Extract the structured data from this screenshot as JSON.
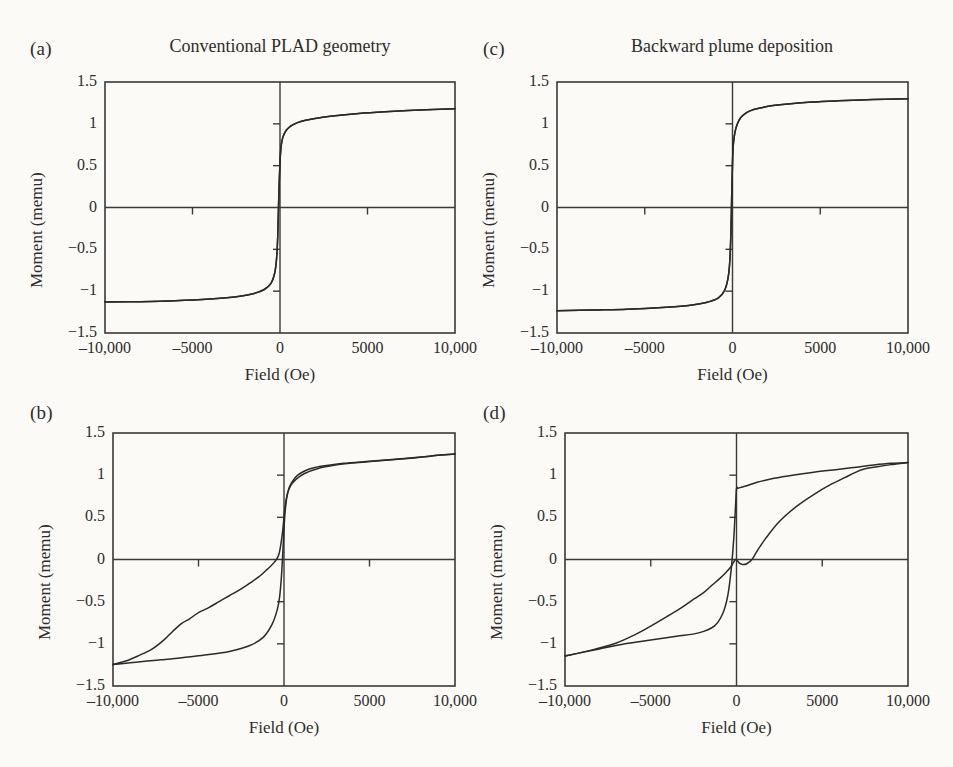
{
  "figure": {
    "background": "#fbfaf7",
    "ink": "#2a2a2a",
    "panel_count": 4
  },
  "panels": [
    {
      "key": "a",
      "label": "(a)",
      "title": "Conventional PLAD geometry",
      "xlabel": "Field (Oe)",
      "ylabel": "Moment (memu)"
    },
    {
      "key": "c",
      "label": "(c)",
      "title": "Backward plume deposition",
      "xlabel": "Field (Oe)",
      "ylabel": "Moment (memu)"
    },
    {
      "key": "b",
      "label": "(b)",
      "title": "",
      "xlabel": "Field (Oe)",
      "ylabel": "Moment (memu)"
    },
    {
      "key": "d",
      "label": "(d)",
      "title": "",
      "xlabel": "Field (Oe)",
      "ylabel": "Moment (memu)"
    }
  ],
  "axes": {
    "x_ticklabels": [
      "–10,000",
      "–5000",
      "0",
      "5000",
      "10,000"
    ],
    "x_tickvalues": [
      -10000,
      -5000,
      0,
      5000,
      10000
    ],
    "y_ticklabels": [
      "1.5",
      "1",
      "0.5",
      "0",
      "−0.5",
      "−1",
      "−1.5"
    ],
    "y_tickvalues": [
      1.5,
      1,
      0.5,
      0,
      -0.5,
      -1,
      -1.5
    ],
    "xlim": [
      -10000,
      10000
    ],
    "ylim": [
      -1.5,
      1.5
    ],
    "grid": false,
    "interior_ticks_on_zero_axes": true
  },
  "chart_data": [
    {
      "id": "a",
      "type": "line",
      "title": "Conventional PLAD geometry",
      "panel_label": "(a)",
      "xlabel": "Field (Oe)",
      "ylabel": "Moment (memu)",
      "xlim": [
        -10000,
        10000
      ],
      "ylim": [
        -1.5,
        1.5
      ],
      "grid": false,
      "legend": "none",
      "description": "Narrow soft-magnetic hysteresis loop, small coercivity, saturation about 1.18 memu",
      "saturation_moment": 1.18,
      "coercivity_oe": 160,
      "remanence_memu": 0.6,
      "series": [
        {
          "name": "descending-branch",
          "x": [
            10000,
            8000,
            6000,
            4500,
            3000,
            2000,
            1400,
            1000,
            700,
            450,
            300,
            180,
            90,
            20,
            -60,
            -130,
            -200,
            -300,
            -500,
            -900,
            -1600,
            -2600,
            -4000,
            -6000,
            -8000,
            -10000
          ],
          "y": [
            1.18,
            1.165,
            1.145,
            1.125,
            1.095,
            1.065,
            1.04,
            1.015,
            0.985,
            0.945,
            0.905,
            0.85,
            0.77,
            0.62,
            0.2,
            -0.35,
            -0.62,
            -0.78,
            -0.9,
            -0.98,
            -1.035,
            -1.07,
            -1.095,
            -1.115,
            -1.125,
            -1.13
          ]
        },
        {
          "name": "ascending-branch",
          "x": [
            -10000,
            -8000,
            -6000,
            -4000,
            -2600,
            -1600,
            -900,
            -500,
            -300,
            -200,
            -130,
            -60,
            20,
            90,
            180,
            300,
            450,
            700,
            1000,
            1400,
            2000,
            3000,
            4500,
            6000,
            8000,
            10000
          ],
          "y": [
            -1.13,
            -1.125,
            -1.115,
            -1.095,
            -1.07,
            -1.035,
            -0.98,
            -0.9,
            -0.78,
            -0.62,
            -0.35,
            0.2,
            0.62,
            0.77,
            0.85,
            0.905,
            0.945,
            0.985,
            1.015,
            1.04,
            1.065,
            1.095,
            1.125,
            1.145,
            1.165,
            1.18
          ]
        }
      ]
    },
    {
      "id": "c",
      "type": "line",
      "title": "Backward plume deposition",
      "panel_label": "(c)",
      "xlabel": "Field (Oe)",
      "ylabel": "Moment (memu)",
      "xlim": [
        -10000,
        10000
      ],
      "ylim": [
        -1.5,
        1.5
      ],
      "grid": false,
      "legend": "none",
      "description": "Narrow soft-magnetic hysteresis loop, saturation about 1.30 memu",
      "saturation_moment": 1.3,
      "coercivity_oe": 120,
      "remanence_memu": 0.55,
      "series": [
        {
          "name": "descending-branch",
          "x": [
            10000,
            8000,
            6000,
            4500,
            3000,
            2200,
            1500,
            1000,
            700,
            450,
            280,
            150,
            60,
            10,
            -40,
            -90,
            -160,
            -260,
            -450,
            -800,
            -1500,
            -2500,
            -4000,
            -6000,
            -8000,
            -10000
          ],
          "y": [
            1.3,
            1.29,
            1.275,
            1.26,
            1.235,
            1.215,
            1.185,
            1.155,
            1.12,
            1.07,
            1.0,
            0.91,
            0.78,
            0.6,
            0.2,
            -0.3,
            -0.66,
            -0.85,
            -0.99,
            -1.08,
            -1.135,
            -1.17,
            -1.195,
            -1.215,
            -1.225,
            -1.235
          ]
        },
        {
          "name": "ascending-branch",
          "x": [
            -10000,
            -8000,
            -6000,
            -4000,
            -2500,
            -1500,
            -800,
            -450,
            -260,
            -160,
            -90,
            -40,
            10,
            60,
            150,
            280,
            450,
            700,
            1000,
            1500,
            2200,
            3000,
            4500,
            6000,
            8000,
            10000
          ],
          "y": [
            -1.235,
            -1.225,
            -1.215,
            -1.195,
            -1.17,
            -1.135,
            -1.08,
            -0.99,
            -0.85,
            -0.66,
            -0.3,
            0.2,
            0.6,
            0.78,
            0.91,
            1.0,
            1.07,
            1.12,
            1.155,
            1.185,
            1.215,
            1.235,
            1.26,
            1.275,
            1.29,
            1.3
          ]
        }
      ]
    },
    {
      "id": "b",
      "type": "line",
      "title": "",
      "panel_label": "(b)",
      "xlabel": "Field (Oe)",
      "ylabel": "Moment (memu)",
      "xlim": [
        -10000,
        10000
      ],
      "ylim": [
        -1.5,
        1.5
      ],
      "grid": false,
      "legend": "none",
      "description": "Wide open hysteresis loop with a distinct shoulder near -6500 Oe on the descending branch; two-phase exchange-spring behaviour",
      "saturation_moment": 1.25,
      "coercivity_oe": 800,
      "remanence_memu": 0.95,
      "series": [
        {
          "name": "descending-branch",
          "x": [
            10000,
            9000,
            8000,
            6500,
            5000,
            3500,
            2500,
            1800,
            1200,
            800,
            500,
            300,
            150,
            40,
            -60,
            -150,
            -260,
            -400,
            -700,
            -1200,
            -2000,
            -3200,
            -4500,
            -5600,
            -6400,
            -7200,
            -8000,
            -9000,
            -10000
          ],
          "y": [
            1.25,
            1.235,
            1.215,
            1.19,
            1.165,
            1.14,
            1.115,
            1.09,
            1.05,
            1.0,
            0.93,
            0.85,
            0.72,
            0.5,
            0.12,
            -0.2,
            -0.45,
            -0.6,
            -0.77,
            -0.92,
            -1.02,
            -1.09,
            -1.13,
            -1.155,
            -1.175,
            -1.19,
            -1.205,
            -1.225,
            -1.245
          ]
        },
        {
          "name": "ascending-branch",
          "x": [
            -10000,
            -9200,
            -8500,
            -7700,
            -7000,
            -6500,
            -6000,
            -5500,
            -5000,
            -4400,
            -3800,
            -3200,
            -2600,
            -2000,
            -1500,
            -1000,
            -600,
            -300,
            -100,
            60,
            200,
            400,
            700,
            1200,
            2000,
            3000,
            4000,
            5200,
            6500,
            7600,
            8500,
            9200,
            10000
          ],
          "y": [
            -1.245,
            -1.2,
            -1.14,
            -1.06,
            -0.95,
            -0.85,
            -0.76,
            -0.7,
            -0.63,
            -0.57,
            -0.5,
            -0.43,
            -0.36,
            -0.28,
            -0.21,
            -0.12,
            -0.04,
            0.06,
            0.3,
            0.62,
            0.78,
            0.88,
            0.95,
            1.02,
            1.08,
            1.12,
            1.145,
            1.165,
            1.185,
            1.205,
            1.225,
            1.24,
            1.25
          ]
        }
      ]
    },
    {
      "id": "d",
      "type": "line",
      "title": "",
      "panel_label": "(d)",
      "xlabel": "Field (Oe)",
      "ylabel": "Moment (memu)",
      "xlim": [
        -10000,
        10000
      ],
      "ylim": [
        -1.5,
        1.5
      ],
      "grid": false,
      "legend": "none",
      "description": "Wide open loop with an abrupt near-zero-field jump from -0.85 to +0.85 memu on the reversing branch; sheared second branch saturating near 7000 Oe",
      "saturation_moment": 1.15,
      "coercivity_oe": 950,
      "remanence_memu": 0.85,
      "series": [
        {
          "name": "descending-branch",
          "x": [
            10000,
            9000,
            8000,
            7000,
            6000,
            4500,
            3000,
            2000,
            1200,
            600,
            250,
            80,
            0,
            -60,
            -160,
            -300,
            -500,
            -800,
            -1300,
            -2200,
            -3500,
            -5000,
            -6500,
            -8000,
            -9200,
            -10000
          ],
          "y": [
            1.15,
            1.14,
            1.12,
            1.095,
            1.07,
            1.035,
            0.99,
            0.955,
            0.915,
            0.875,
            0.855,
            0.845,
            0.84,
            0.62,
            0.25,
            -0.1,
            -0.42,
            -0.64,
            -0.79,
            -0.87,
            -0.91,
            -0.955,
            -1.0,
            -1.06,
            -1.11,
            -1.145
          ]
        },
        {
          "name": "ascending-branch",
          "x": [
            -10000,
            -9200,
            -8200,
            -7000,
            -6000,
            -5000,
            -4000,
            -3200,
            -2500,
            -1900,
            -1400,
            -1000,
            -600,
            -300,
            -60,
            150,
            350,
            600,
            900,
            1200,
            1700,
            2500,
            3500,
            4500,
            5500,
            6300,
            6900,
            7400,
            8200,
            9000,
            10000
          ],
          "y": [
            -1.145,
            -1.11,
            -1.06,
            -0.99,
            -0.9,
            -0.79,
            -0.67,
            -0.57,
            -0.47,
            -0.39,
            -0.3,
            -0.23,
            -0.15,
            -0.08,
            0.0,
            -0.04,
            -0.06,
            -0.05,
            0.0,
            0.1,
            0.25,
            0.45,
            0.63,
            0.77,
            0.89,
            0.97,
            1.03,
            1.07,
            1.1,
            1.125,
            1.15
          ]
        }
      ]
    }
  ]
}
